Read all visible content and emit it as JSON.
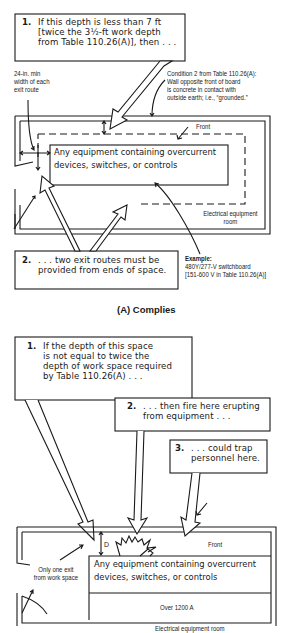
{
  "panel_a": {
    "callout_1": {
      "number": "1.",
      "lines": [
        "If this depth is less than 7 ft",
        "[twice the 3½-ft work depth",
        "from Table 110.26(A)], then . . ."
      ]
    },
    "note_exit_width": [
      "24-in. min",
      "width of each",
      "exit route"
    ],
    "note_condition": [
      "Condition 2 from Table 110.26(A):",
      "Wall opposite front of board",
      "is concrete in contact with",
      "outside earth; i.e., “grounded.”"
    ],
    "front_label": "Front",
    "equipment": [
      "Any equipment containing overcurrent",
      "devices, switches, or controls"
    ],
    "room_label": [
      "Electrical equipment",
      "room"
    ],
    "callout_2": {
      "number": "2.",
      "lines": [
        ". . . two exit routes must be",
        "provided from ends of space."
      ]
    },
    "example": {
      "title": "Example:",
      "lines": [
        "480Y/277-V switchboard",
        "[151-600 V in Table 110.26(A)]"
      ]
    },
    "caption": "(A) Complies"
  },
  "panel_b": {
    "callout_1": {
      "number": "1.",
      "lines": [
        "If the depth of this space",
        "is not equal to twice the",
        "depth of work space required",
        "by Table 110.26(A) . . ."
      ]
    },
    "callout_2": {
      "number": "2.",
      "lines": [
        ". . . then fire here erupting",
        "from equipment . . ."
      ]
    },
    "callout_3": {
      "number": "3.",
      "lines": [
        ". . . could trap",
        "personnel here."
      ]
    },
    "depth_label": "D",
    "front_label": "Front",
    "one_exit_note": [
      "Only one exit",
      "from work space"
    ],
    "equipment": [
      "Any equipment containing overcurrent",
      "devices, switches, or controls"
    ],
    "rating_label": "Over 1200 A",
    "room_label": "Electrical equipment room"
  }
}
